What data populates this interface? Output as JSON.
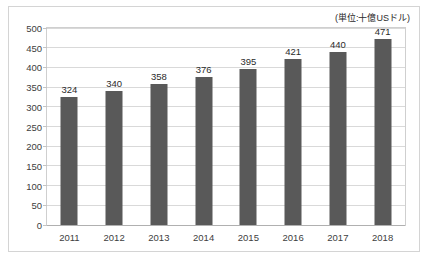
{
  "chart_data": {
    "type": "bar",
    "title": "",
    "subtitle": "",
    "annotation": "(単位:十億USドル)",
    "categories": [
      "2011",
      "2012",
      "2013",
      "2014",
      "2015",
      "2016",
      "2017",
      "2018"
    ],
    "values": [
      324,
      340,
      358,
      376,
      395,
      421,
      440,
      471
    ],
    "data_labels": [
      "324",
      "340",
      "358",
      "376",
      "395",
      "421",
      "440",
      "471"
    ],
    "xlabel": "",
    "ylabel": "",
    "ylim": [
      0,
      500
    ],
    "yticks": [
      0,
      50,
      100,
      150,
      200,
      250,
      300,
      350,
      400,
      450,
      500
    ],
    "ytick_labels": [
      "0",
      "50",
      "100",
      "150",
      "200",
      "250",
      "300",
      "350",
      "400",
      "450",
      "500"
    ],
    "grid": true,
    "legend": false,
    "legend_position": "none",
    "series": [
      {
        "name": "",
        "values": [
          324,
          340,
          358,
          376,
          395,
          421,
          440,
          471
        ],
        "color": "#595959"
      }
    ]
  },
  "colors": {
    "bar": "#595959",
    "gridline": "#d9d9d9",
    "plot_border": "#cfcfcf",
    "frame_border": "#d4d4d4",
    "text": "#404040",
    "background": "#ffffff"
  }
}
